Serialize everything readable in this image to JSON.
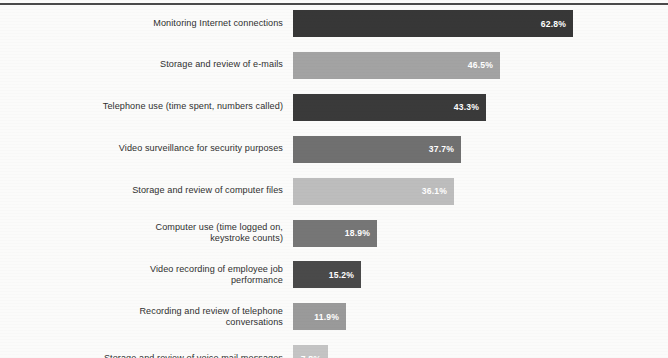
{
  "chart_data": {
    "type": "bar",
    "orientation": "horizontal",
    "title": "",
    "subtitle": "",
    "xlabel": "",
    "ylabel": "",
    "xlim": [
      0,
      62.8
    ],
    "grid": false,
    "legend": null,
    "value_suffix": "%",
    "categories": [
      "Monitoring Internet connections",
      "Storage and review of e-mails",
      "Telephone use (time spent, numbers called)",
      "Video surveillance for security purposes",
      "Storage and review of computer files",
      "Computer use (time logged on,\nkeystroke counts)",
      "Video recording of employee job\nperformance",
      "Recording and review of telephone\nconversations",
      "Storage and review of voice mail messages"
    ],
    "values": [
      62.8,
      46.5,
      43.3,
      37.7,
      36.1,
      18.9,
      15.2,
      11.9,
      7.8
    ],
    "value_labels": [
      "62.8%",
      "46.5%",
      "43.3%",
      "37.7%",
      "36.1%",
      "18.9%",
      "15.2%",
      "11.9%",
      "7.8%"
    ],
    "bar_colors": [
      "#373737",
      "#a3a3a3",
      "#3a3a3a",
      "#707070",
      "#bdbdbd",
      "#767676",
      "#4a4a4a",
      "#9a9a9a",
      "#c4c4c4"
    ]
  },
  "style": {
    "page_background": "#fbfbfa",
    "rule_color": "#4a4a4a",
    "label_color": "#2f2f2f",
    "value_text_color": "#ffffff"
  }
}
